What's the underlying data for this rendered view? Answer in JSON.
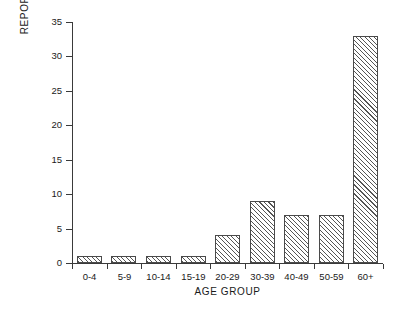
{
  "chart_data": {
    "type": "bar",
    "title": "",
    "subtitle": "",
    "xlabel": "AGE GROUP",
    "ylabel": "REPORTED CASES",
    "categories": [
      "0-4",
      "5-9",
      "10-14",
      "15-19",
      "20-29",
      "30-39",
      "40-49",
      "50-59",
      "60+"
    ],
    "values": [
      1,
      1,
      1,
      1,
      4,
      9,
      7,
      7,
      33
    ],
    "series": [
      {
        "name": "Reported cases",
        "values": [
          1,
          1,
          1,
          1,
          4,
          9,
          7,
          7,
          33
        ]
      }
    ],
    "ylim": [
      0,
      35
    ],
    "xlim": [
      0,
      9
    ],
    "y_ticks": [
      0,
      5,
      10,
      15,
      20,
      25,
      30,
      35
    ],
    "y_tick_labels": [
      "0",
      "5",
      "10",
      "15",
      "20",
      "25",
      "30",
      "35"
    ],
    "grid": false,
    "legend": false,
    "legend_position": "none",
    "annotations": [],
    "bar_fill": "diagonal-hatch",
    "bar_edge_color": "#4a4a4a",
    "axis_color": "#3a3a3a",
    "background_color": "#ffffff",
    "text_color": "#1a1a1a"
  }
}
